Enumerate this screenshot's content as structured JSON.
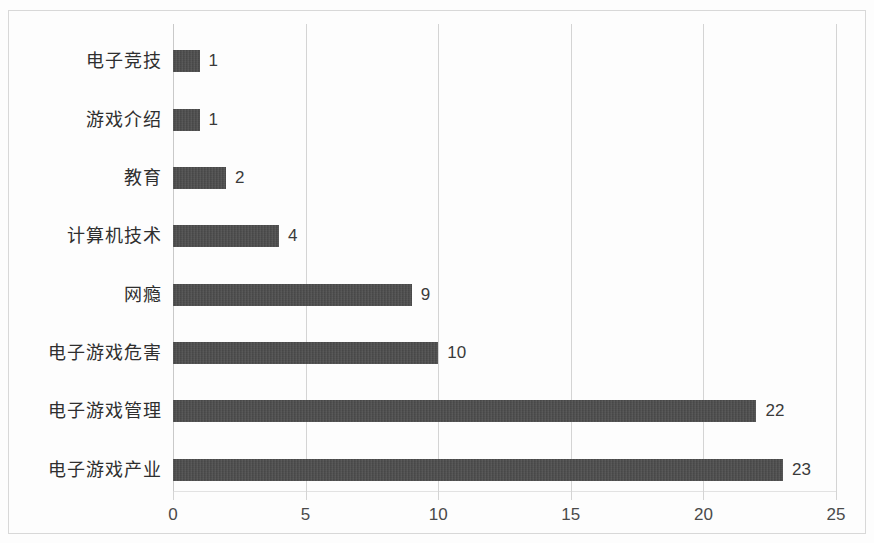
{
  "chart_data": {
    "type": "bar",
    "orientation": "horizontal",
    "title": "",
    "subtitle": "",
    "xlabel": "",
    "ylabel": "",
    "categories": [
      "电子竞技",
      "游戏介绍",
      "教育",
      "计算机技术",
      "网瘾",
      "电子游戏危害",
      "电子游戏管理",
      "电子游戏产业"
    ],
    "values": [
      1,
      1,
      2,
      4,
      9,
      10,
      22,
      23
    ],
    "data_labels": [
      "1",
      "1",
      "2",
      "4",
      "9",
      "10",
      "22",
      "23"
    ],
    "xlim": [
      0,
      25
    ],
    "xticks": [
      0,
      5,
      10,
      15,
      20,
      25
    ],
    "xtick_labels": [
      "0",
      "5",
      "10",
      "15",
      "20",
      "25"
    ],
    "grid": "vertical",
    "legend": "none",
    "bar_color": "#4b4b4b",
    "gridline_color": "#d4d4d4",
    "data_label_position": "outside-end"
  }
}
